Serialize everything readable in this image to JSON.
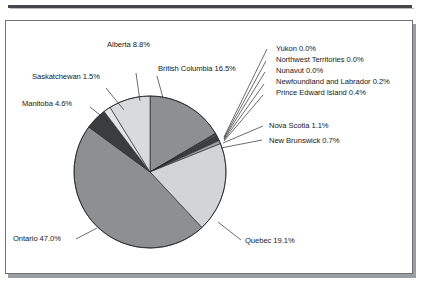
{
  "figure": {
    "panel_border_color": "#6e7176",
    "panel_background": "#ffffff",
    "shadow_color": "#9a9da1",
    "rule_color": "#43464b"
  },
  "chart_data": {
    "type": "pie",
    "title": "",
    "subtitle": "",
    "xlabel": "",
    "ylabel": "",
    "grid": false,
    "legend_position": "none",
    "labels_show_percent": true,
    "units": "percent",
    "total": 100.0,
    "start_angle_deg": 0,
    "direction": "clockwise",
    "center": {
      "x": 150,
      "y": 172
    },
    "radius": 76,
    "categories": [
      "British Columbia",
      "Yukon",
      "Northwest Territories",
      "Nunavut",
      "Newfoundland and Labrador",
      "Prince Edward Island",
      "Nova Scotia",
      "New Brunswick",
      "Quebec",
      "Ontario",
      "Manitoba",
      "Saskatchewan",
      "Alberta"
    ],
    "values": [
      16.5,
      0.0,
      0.0,
      0.0,
      0.2,
      0.4,
      1.1,
      0.7,
      19.1,
      47.0,
      4.6,
      1.5,
      8.8
    ],
    "colors": [
      "#8d8f91",
      "#c9cbcd",
      "#b4b6b8",
      "#9fa1a3",
      "#6f7173",
      "#5a5c5e",
      "#3c3e40",
      "#9fa1a3",
      "#d2d4d6",
      "#8d8f91",
      "#3a3c3e",
      "#e2e4e6",
      "#d8dadc"
    ],
    "slice_labels": [
      "British Columbia 16.5%",
      "Yukon 0.0%",
      "Northwest Territories 0.0%",
      "Nunavut 0.0%",
      "Newfoundland and Labrador 0.2%",
      "Prince Edward Island 0.4%",
      "Nova Scotia 1.1%",
      "New Brunswick 0.7%",
      "Quebec 19.1%",
      "Ontario 47.0%",
      "Manitoba 4.6%",
      "Saskatchewan 1.5%",
      "Alberta 8.8%"
    ]
  },
  "labels": {
    "alberta": "Alberta 8.8%",
    "british_columbia": "British Columbia 16.5%",
    "saskatchewan": "Saskatchewan 1.5%",
    "manitoba": "Manitoba 4.6%",
    "yukon": "Yukon 0.0%",
    "northwest_territories": "Northwest Territories 0.0%",
    "nunavut": "Nunavut 0.0%",
    "newfoundland_and_labrador": "Newfoundland and Labrador 0.2%",
    "prince_edward_island": "Prince Edward Island 0.4%",
    "nova_scotia": "Nova Scotia 1.1%",
    "new_brunswick": "New Brunswick 0.7%",
    "ontario": "Ontario 47.0%",
    "quebec": "Quebec 19.1%"
  }
}
